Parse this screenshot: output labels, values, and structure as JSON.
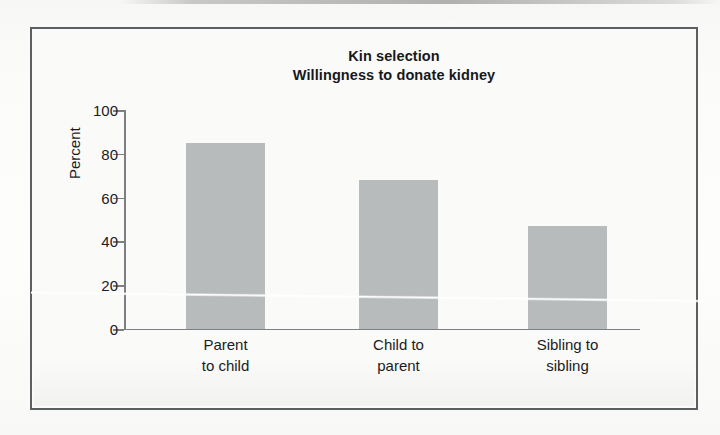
{
  "figure": {
    "title_line1": "Kin selection",
    "title_line2": "Willingness to donate kidney",
    "frame_color": "#5c5f61",
    "background_color": "#fafaf9"
  },
  "chart_data": {
    "type": "bar",
    "title": "Kin selection\nWillingness to donate kidney",
    "categories": [
      "Parent to child",
      "Child to parent",
      "Sibling to sibling"
    ],
    "category_lines": [
      [
        "Parent",
        "to child"
      ],
      [
        "Child to",
        "parent"
      ],
      [
        "Sibling to",
        "sibling"
      ]
    ],
    "values": [
      85,
      68,
      47
    ],
    "xlabel": "",
    "ylabel": "Percent",
    "ylim": [
      0,
      100
    ],
    "yticks": [
      0,
      20,
      40,
      60,
      80,
      100
    ],
    "ytick_labels": [
      "0",
      "20",
      "40",
      "60",
      "80",
      "100"
    ],
    "grid": false,
    "legend": false,
    "bar_color": "#b8bbbc",
    "axis_color": "#7d8082"
  },
  "annotations": {
    "scan_crease": "white diagonal fold line across the scanned page"
  }
}
